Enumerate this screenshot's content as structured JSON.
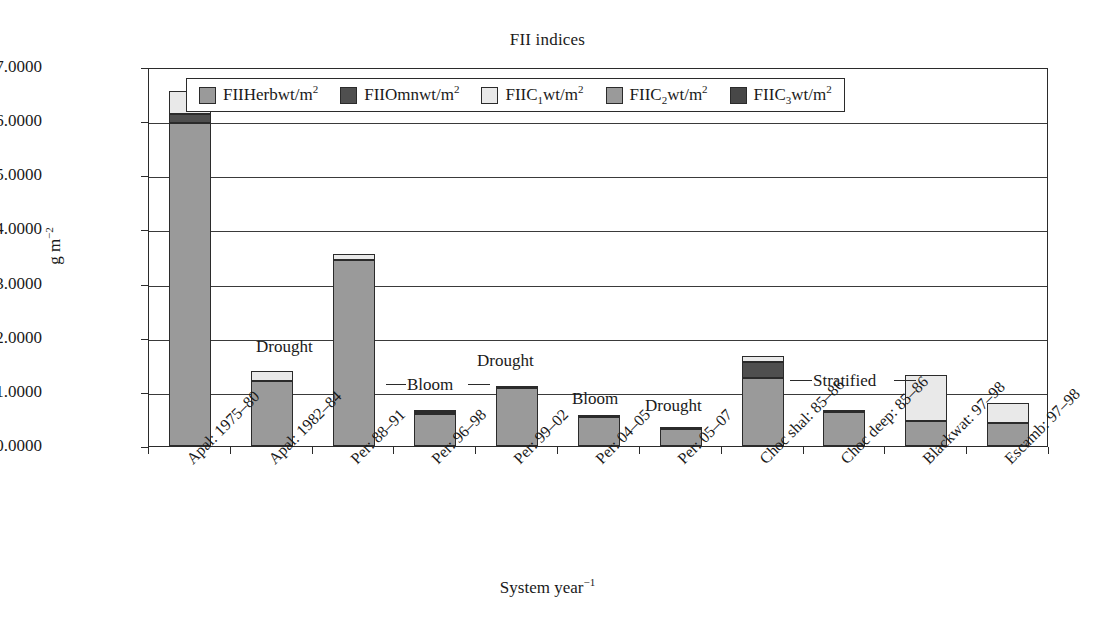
{
  "chart_data": {
    "type": "bar",
    "stacked": true,
    "title": "FII indices",
    "xlabel": "System year⁻¹",
    "ylabel": "g m⁻²",
    "ylim": [
      0,
      7
    ],
    "ytick_labels": [
      "0.0000",
      "1.0000",
      "2.0000",
      "3.0000",
      "4.0000",
      "5.0000",
      "6.0000",
      "7.0000"
    ],
    "ytick_values": [
      0,
      1,
      2,
      3,
      4,
      5,
      6,
      7
    ],
    "grid": true,
    "legend_position": "top-inside",
    "categories": [
      "Apal: 1975–80",
      "Apal: 1982–84",
      "Per: 88–91",
      "Per: 96–98",
      "Per: 99–02",
      "Per: 04–05",
      "Per: 05–07",
      "Choc shal: 85–86",
      "Choc deep: 85–86",
      "Blackwat: 97–98",
      "Escamb: 97–98"
    ],
    "series": [
      {
        "name": "FIIHerbwt/m2",
        "label_html": "FIIHerbwt/m<sup>2</sup>",
        "color": "#9a9a9a",
        "values": [
          5.97,
          1.2,
          3.44,
          0.6,
          1.08,
          0.53,
          0.32,
          1.25,
          0.62,
          0.46,
          0.42
        ]
      },
      {
        "name": "FIIOmnwt/m2",
        "label_html": "FIIOmnwt/m<sup>2</sup>",
        "color": "#4f4f4f",
        "values": [
          0.17,
          0.0,
          0.0,
          0.02,
          0.0,
          0.0,
          0.0,
          0.3,
          0.0,
          0.0,
          0.0
        ]
      },
      {
        "name": "FIIC1wt/m2",
        "label_html": "FIIC<sub>1</sub>wt/m<sup>2</sup>",
        "color": "#e9e9e9",
        "values": [
          0.41,
          0.19,
          0.1,
          0.01,
          0.02,
          0.01,
          0.01,
          0.11,
          0.02,
          0.85,
          0.37
        ]
      },
      {
        "name": "FIIC2wt/m2",
        "label_html": "FIIC<sub>2</sub>wt/m<sup>2</sup>",
        "color": "#9a9a9a",
        "values": [
          0.0,
          0.0,
          0.0,
          0.0,
          0.0,
          0.0,
          0.0,
          0.0,
          0.0,
          0.0,
          0.0
        ]
      },
      {
        "name": "FIIC3wt/m2",
        "label_html": "FIIC<sub>3</sub>wt/m<sup>2</sup>",
        "color": "#474747",
        "values": [
          0.0,
          0.0,
          0.0,
          0.0,
          0.0,
          0.0,
          0.0,
          0.0,
          0.0,
          0.0,
          0.0
        ]
      }
    ],
    "totals": [
      6.55,
      1.39,
      3.54,
      0.63,
      1.1,
      0.54,
      0.33,
      1.66,
      0.64,
      1.31,
      0.79
    ],
    "annotations": [
      {
        "text": "Drought",
        "category": "Apal: 1982–84",
        "left": 256,
        "top": 337,
        "leaders": []
      },
      {
        "text": "Bloom",
        "category": "Per: 96–98",
        "left": 407,
        "top": 375,
        "leaders": [
          {
            "left": 386,
            "top": 384,
            "width": 20
          },
          {
            "left": 468,
            "top": 384,
            "width": 22
          }
        ]
      },
      {
        "text": "Drought",
        "category": "Per: 99–02",
        "left": 477,
        "top": 351,
        "leaders": []
      },
      {
        "text": "Bloom",
        "category": "Per: 04–05",
        "left": 572,
        "top": 389,
        "leaders": []
      },
      {
        "text": "Drought",
        "category": "Per: 05–07",
        "left": 645,
        "top": 396,
        "leaders": []
      },
      {
        "text": "Stratified",
        "category": "Choc deep: 85–86",
        "left": 813,
        "top": 371,
        "leaders": [
          {
            "left": 790,
            "top": 380,
            "width": 22
          },
          {
            "left": 894,
            "top": 380,
            "width": 22
          }
        ]
      }
    ]
  },
  "legend": {
    "items": [
      {
        "label_html": "FIIHerbwt/m<sup>2</sup>",
        "color": "#9a9a9a",
        "name": "fii-herb"
      },
      {
        "label_html": "FIIOmnwt/m<sup>2</sup>",
        "color": "#4f4f4f",
        "name": "fii-omn"
      },
      {
        "label_html": "FIIC<sub>1</sub>wt/m<sup>2</sup>",
        "color": "#e9e9e9",
        "name": "fii-c1"
      },
      {
        "label_html": "FIIC<sub>2</sub>wt/m<sup>2</sup>",
        "color": "#9a9a9a",
        "name": "fii-c2"
      },
      {
        "label_html": "FIIC<sub>3</sub>wt/m<sup>2</sup>",
        "color": "#474747",
        "name": "fii-c3"
      }
    ]
  }
}
